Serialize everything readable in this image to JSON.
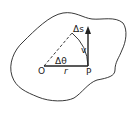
{
  "diagram": {
    "labels": {
      "arc_length": "Δs",
      "velocity": "v",
      "angle": "Δθ",
      "origin": "O",
      "radius": "r",
      "point": "P"
    },
    "colors": {
      "stroke": "#222222",
      "background": "#ffffff"
    }
  }
}
